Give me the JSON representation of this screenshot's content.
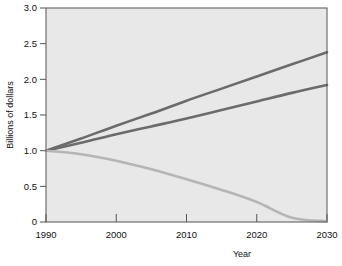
{
  "chart_data": {
    "type": "line",
    "title": "",
    "xlabel": "Year",
    "ylabel": "Billions of dollars",
    "xlim": [
      1990,
      2030
    ],
    "ylim": [
      0,
      3.0
    ],
    "grid": false,
    "legend": "none",
    "x_ticks": [
      "1990",
      "2000",
      "2010",
      "2020",
      "2030"
    ],
    "x_tick_values": [
      1990,
      2000,
      2010,
      2020,
      2030
    ],
    "y_ticks": [
      "0",
      "0.5",
      "1.0",
      "1.5",
      "2.0",
      "2.5",
      "3.0"
    ],
    "y_tick_values": [
      0,
      0.5,
      1.0,
      1.5,
      2.0,
      2.5,
      3.0
    ],
    "x": [
      1990,
      1995,
      2000,
      2005,
      2010,
      2015,
      2020,
      2025,
      2030
    ],
    "series": [
      {
        "name": "upper-rising",
        "color": "#6b6b6b",
        "width": 2.6,
        "values": [
          1.0,
          1.17,
          1.35,
          1.52,
          1.7,
          1.87,
          2.04,
          2.21,
          2.38
        ]
      },
      {
        "name": "lower-rising",
        "color": "#6b6b6b",
        "width": 2.6,
        "values": [
          1.0,
          1.11,
          1.23,
          1.34,
          1.45,
          1.57,
          1.69,
          1.81,
          1.92
        ]
      },
      {
        "name": "declining",
        "color": "#b5b5b5",
        "width": 2.6,
        "values": [
          1.0,
          0.95,
          0.86,
          0.74,
          0.6,
          0.45,
          0.28,
          0.06,
          0.01
        ]
      }
    ]
  }
}
